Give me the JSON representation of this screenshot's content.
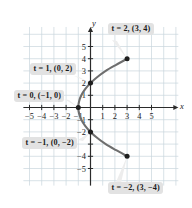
{
  "figure": {
    "name": "parametric-curve-plot",
    "axis_labels": {
      "x": "x",
      "y": "y"
    }
  },
  "callouts": [
    {
      "id": "t2",
      "text": "t = 2, (3, 4)",
      "t": 2,
      "point": [
        3,
        4
      ],
      "tail_to": [
        3,
        4
      ]
    },
    {
      "id": "t1",
      "text": "t = 1, (0, 2)",
      "t": 1,
      "point": [
        0,
        2
      ],
      "tail_to": [
        0,
        2
      ]
    },
    {
      "id": "t0",
      "text": "t = 0, (−1, 0)",
      "t": 0,
      "point": [
        -1,
        0
      ],
      "tail_to": [
        -1,
        0
      ]
    },
    {
      "id": "tm1",
      "text": "t = −1, (0, −2)",
      "t": -1,
      "point": [
        0,
        -2
      ],
      "tail_to": [
        0,
        -2
      ]
    },
    {
      "id": "tm2",
      "text": "t = −2, (3, −4)",
      "t": -2,
      "point": [
        3,
        -4
      ],
      "tail_to": [
        3,
        -4
      ]
    }
  ],
  "chart_data": {
    "type": "line",
    "title": "",
    "xlabel": "x",
    "ylabel": "y",
    "xlim": [
      -6,
      6
    ],
    "ylim": [
      -6,
      6
    ],
    "grid": true,
    "legend": null,
    "x_ticks": [
      -5,
      -4,
      -3,
      -2,
      -1,
      1,
      2,
      3,
      4,
      5
    ],
    "x_tick_labels": [
      "−5",
      "−4",
      "−3",
      "−2",
      "−1",
      "1",
      "2",
      "3",
      "4",
      "5"
    ],
    "y_ticks": [
      5,
      4,
      3,
      2,
      1,
      -1,
      -2,
      -4,
      -5
    ],
    "y_tick_labels": [
      "5",
      "4",
      "3",
      "2",
      "1",
      "−1",
      "−2",
      "−4",
      "−5"
    ],
    "series": [
      {
        "name": "x = t² − 1, y = 2t",
        "color": "#6e6e6e",
        "points": [
          [
            3,
            -4
          ],
          [
            2.1025,
            -3.5
          ],
          [
            1.25,
            -3
          ],
          [
            0.5625,
            -2.5
          ],
          [
            0,
            -2
          ],
          [
            -0.4375,
            -1.5
          ],
          [
            -0.75,
            -1
          ],
          [
            -0.9375,
            -0.5
          ],
          [
            -1,
            0
          ],
          [
            -0.9375,
            0.5
          ],
          [
            -0.75,
            1
          ],
          [
            -0.4375,
            1.5
          ],
          [
            0,
            2
          ],
          [
            0.5625,
            2.5
          ],
          [
            1.25,
            3
          ],
          [
            2.1025,
            3.5
          ],
          [
            3,
            4
          ]
        ]
      }
    ],
    "markers": [
      {
        "t": 2,
        "x": 3,
        "y": 4
      },
      {
        "t": 1,
        "x": 0,
        "y": 2
      },
      {
        "t": 0,
        "x": -1,
        "y": 0
      },
      {
        "t": -1,
        "x": 0,
        "y": -2
      },
      {
        "t": -2,
        "x": 3,
        "y": -4
      }
    ],
    "colors": {
      "curve": "#6e6e6e",
      "marker": "#1e1e1e",
      "axis": "#2b2b2b",
      "grid": "#c9d6dd",
      "callout_bg": "#e2e2e2",
      "callout_text": "#1a1a1a"
    }
  }
}
